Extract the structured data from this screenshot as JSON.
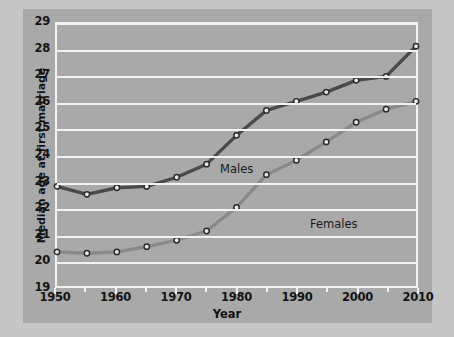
{
  "chart_data": {
    "type": "line",
    "title": "",
    "xlabel": "Year",
    "ylabel": "Median age at first marriage",
    "xlim": [
      1950,
      2010
    ],
    "ylim": [
      19,
      29
    ],
    "grid": true,
    "legend_position": "inline-annotations",
    "xticks": [
      1950,
      1960,
      1970,
      1980,
      1990,
      2000,
      2010
    ],
    "xminorticks": [
      1955,
      1965,
      1975,
      1985,
      1995,
      2005
    ],
    "yticks": [
      19,
      20,
      21,
      22,
      23,
      24,
      25,
      26,
      27,
      28,
      29
    ],
    "x": [
      1950,
      1955,
      1960,
      1965,
      1970,
      1975,
      1980,
      1985,
      1990,
      1995,
      2000,
      2005,
      2010
    ],
    "series": [
      {
        "name": "Males",
        "color": "#4a4a4a",
        "marker": "circle-open",
        "values": [
          22.8,
          22.5,
          22.75,
          22.8,
          23.15,
          23.65,
          24.75,
          25.7,
          26.05,
          26.4,
          26.85,
          27.0,
          28.15
        ]
      },
      {
        "name": "Females",
        "color": "#8a8a8a",
        "marker": "circle-open",
        "values": [
          20.3,
          20.25,
          20.3,
          20.5,
          20.75,
          21.1,
          22.0,
          23.25,
          23.8,
          24.5,
          25.25,
          25.75,
          26.05
        ]
      }
    ],
    "annotations": [
      {
        "text": "Males",
        "x": 1975,
        "y": 24.4
      },
      {
        "text": "Females",
        "x": 1990,
        "y": 22.55
      }
    ]
  },
  "colors": {
    "figure_background": "#c6c6c6",
    "panel_background": "#a9a9a9",
    "gridline": "#f4f4f4",
    "axis_border": "#f2f2f2",
    "text": "#141414",
    "males_line": "#4a4a4a",
    "females_line": "#8a8a8a",
    "marker_fill": "#e8e8e8",
    "marker_stroke": "#2b2b2b"
  },
  "axis": {
    "y_title": "Median age at first marriage",
    "x_title": "Year",
    "y_tick_labels": [
      "29",
      "28",
      "27",
      "26",
      "25",
      "24",
      "23",
      "22",
      "21",
      "20",
      "19"
    ],
    "x_tick_labels": [
      "1950",
      "1960",
      "1970",
      "1980",
      "1990",
      "2000",
      "2010"
    ]
  },
  "labels": {
    "males": "Males",
    "females": "Females"
  }
}
